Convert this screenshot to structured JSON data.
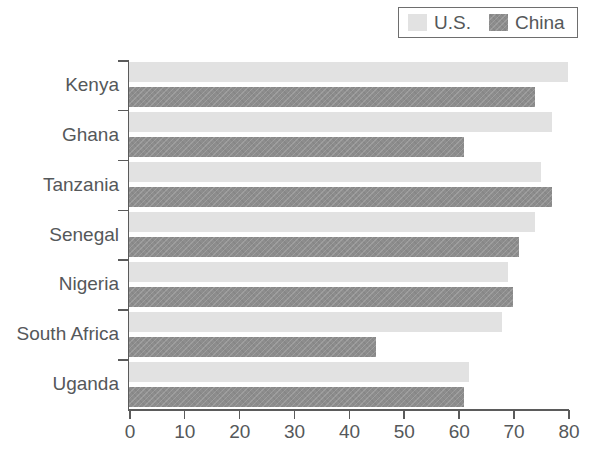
{
  "legend": {
    "entries": [
      {
        "label": "U.S.",
        "key": "us",
        "color": "#e2e2e2",
        "swatch_name": "legend-swatch-us"
      },
      {
        "label": "China",
        "key": "china",
        "color": "#8d8d8d",
        "swatch_name": "legend-swatch-china"
      }
    ]
  },
  "axis": {
    "x_ticks": [
      "0",
      "10",
      "20",
      "30",
      "40",
      "50",
      "60",
      "70",
      "80"
    ]
  },
  "chart_data": {
    "type": "bar",
    "orientation": "horizontal",
    "title": "",
    "subtitle": "",
    "xlabel": "",
    "ylabel": "",
    "xlim": [
      0,
      80
    ],
    "xticks": [
      0,
      10,
      20,
      30,
      40,
      50,
      60,
      70,
      80
    ],
    "grid": false,
    "legend_position": "top-right",
    "categories": [
      "Kenya",
      "Ghana",
      "Tanzania",
      "Senegal",
      "Nigeria",
      "South Africa",
      "Uganda"
    ],
    "series": [
      {
        "name": "U.S.",
        "color": "#e2e2e2",
        "values": [
          80,
          77,
          75,
          74,
          69,
          68,
          62
        ]
      },
      {
        "name": "China",
        "color": "#8d8d8d",
        "values": [
          74,
          61,
          77,
          71,
          70,
          45,
          61
        ]
      }
    ]
  }
}
